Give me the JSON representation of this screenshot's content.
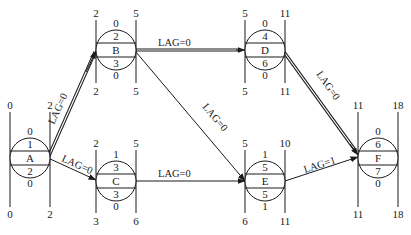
{
  "diagram": {
    "type": "precedence network (single-code network) with time parameters",
    "legend_layout": "node circle rows: top=free float, 2nd=ES-index/duration-top, middle=name, 4th=duration, bottom=total float; outer vertical numbers: top-left=ES, top-right=EF, bottom-left=LS, bottom-right=LF"
  },
  "nodes": [
    {
      "id": "A",
      "name": "A",
      "top": "0",
      "upper": "1",
      "lower": "2",
      "bottom": "0",
      "es": "0",
      "ef": "2",
      "ls": "0",
      "lf": "2"
    },
    {
      "id": "B",
      "name": "B",
      "top": "0",
      "upper": "2",
      "lower": "3",
      "bottom": "0",
      "es": "2",
      "ef": "5",
      "ls": "2",
      "lf": "5"
    },
    {
      "id": "C",
      "name": "C",
      "top": "1",
      "upper": "3",
      "lower": "3",
      "bottom": "0",
      "es": "2",
      "ef": "5",
      "ls": "3",
      "lf": "6"
    },
    {
      "id": "D",
      "name": "D",
      "top": "0",
      "upper": "4",
      "lower": "6",
      "bottom": "0",
      "es": "5",
      "ef": "11",
      "ls": "5",
      "lf": "11"
    },
    {
      "id": "E",
      "name": "E",
      "top": "1",
      "upper": "5",
      "lower": "5",
      "bottom": "1",
      "es": "5",
      "ef": "10",
      "ls": "6",
      "lf": "11"
    },
    {
      "id": "F",
      "name": "F",
      "top": "0",
      "upper": "6",
      "lower": "7",
      "bottom": "0",
      "es": "11",
      "ef": "18",
      "ls": "11",
      "lf": "18"
    }
  ],
  "links": [
    {
      "from": "A",
      "to": "B",
      "label": "LAG=0",
      "critical": true
    },
    {
      "from": "A",
      "to": "C",
      "label": "LAG=0",
      "critical": false
    },
    {
      "from": "B",
      "to": "D",
      "label": "LAG=0",
      "critical": true
    },
    {
      "from": "B",
      "to": "E",
      "label": "LAG=0",
      "critical": false
    },
    {
      "from": "C",
      "to": "E",
      "label": "LAG=0",
      "critical": false
    },
    {
      "from": "D",
      "to": "F",
      "label": "LAG=0",
      "critical": true
    },
    {
      "from": "E",
      "to": "F",
      "label": "LAG=1",
      "critical": false
    }
  ]
}
